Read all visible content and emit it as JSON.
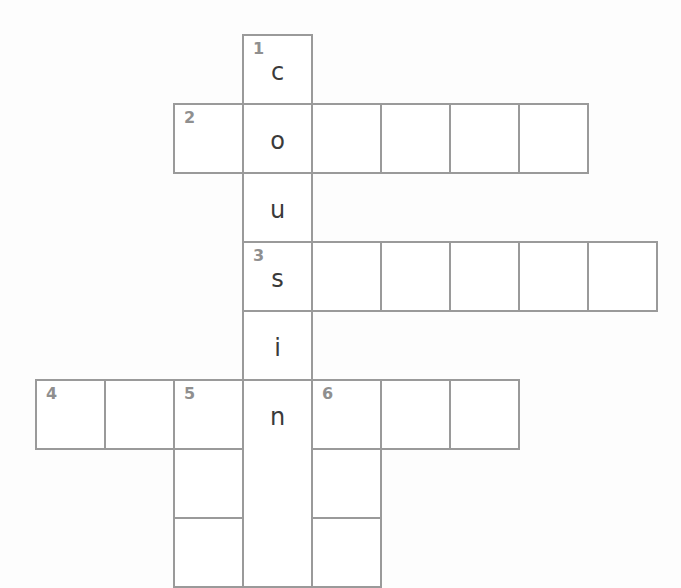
{
  "puzzle": {
    "cell_size": 69,
    "origin": {
      "x": 36,
      "y": 35
    },
    "border_color": "#9a9a9a",
    "number_color": "#8f8f8f",
    "letter_color": "#3a3a3a",
    "clues": [
      {
        "number": "1",
        "direction": "down",
        "answer_shown": "cousin"
      },
      {
        "number": "2",
        "direction": "across"
      },
      {
        "number": "3",
        "direction": "across"
      },
      {
        "number": "4",
        "direction": "across"
      },
      {
        "number": "5",
        "direction": "down"
      },
      {
        "number": "6",
        "direction": "down"
      }
    ],
    "cells": [
      {
        "col": 3,
        "row": 0,
        "number": "1",
        "letter": "c"
      },
      {
        "col": 2,
        "row": 1,
        "number": "2",
        "letter": ""
      },
      {
        "col": 3,
        "row": 1,
        "number": "",
        "letter": "o"
      },
      {
        "col": 4,
        "row": 1,
        "number": "",
        "letter": ""
      },
      {
        "col": 5,
        "row": 1,
        "number": "",
        "letter": ""
      },
      {
        "col": 6,
        "row": 1,
        "number": "",
        "letter": ""
      },
      {
        "col": 7,
        "row": 1,
        "number": "",
        "letter": ""
      },
      {
        "col": 3,
        "row": 2,
        "number": "",
        "letter": "u"
      },
      {
        "col": 3,
        "row": 3,
        "number": "3",
        "letter": "s"
      },
      {
        "col": 4,
        "row": 3,
        "number": "",
        "letter": ""
      },
      {
        "col": 5,
        "row": 3,
        "number": "",
        "letter": ""
      },
      {
        "col": 6,
        "row": 3,
        "number": "",
        "letter": ""
      },
      {
        "col": 7,
        "row": 3,
        "number": "",
        "letter": ""
      },
      {
        "col": 8,
        "row": 3,
        "number": "",
        "letter": ""
      },
      {
        "col": 3,
        "row": 4,
        "number": "",
        "letter": "i"
      },
      {
        "col": 0,
        "row": 5,
        "number": "4",
        "letter": ""
      },
      {
        "col": 1,
        "row": 5,
        "number": "",
        "letter": ""
      },
      {
        "col": 2,
        "row": 5,
        "number": "5",
        "letter": ""
      },
      {
        "col": 3,
        "row": 5,
        "number": "",
        "letter": "n",
        "open": "bottom"
      },
      {
        "col": 4,
        "row": 5,
        "number": "6",
        "letter": ""
      },
      {
        "col": 5,
        "row": 5,
        "number": "",
        "letter": ""
      },
      {
        "col": 6,
        "row": 5,
        "number": "",
        "letter": ""
      },
      {
        "col": 2,
        "row": 6,
        "number": "",
        "letter": ""
      },
      {
        "col": 3,
        "row": 6,
        "number": "",
        "letter": "",
        "open": "both"
      },
      {
        "col": 4,
        "row": 6,
        "number": "",
        "letter": ""
      },
      {
        "col": 2,
        "row": 7,
        "number": "",
        "letter": ""
      },
      {
        "col": 3,
        "row": 7,
        "number": "",
        "letter": "",
        "open": "top"
      },
      {
        "col": 4,
        "row": 7,
        "number": "",
        "letter": ""
      }
    ]
  }
}
